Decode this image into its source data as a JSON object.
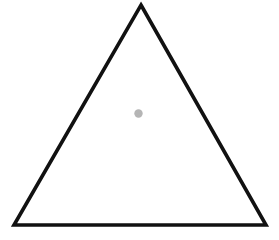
{
  "canvas": {
    "width": 279,
    "height": 240,
    "background_color": "#ffffff"
  },
  "figure": {
    "name": "triangle-with-interior-dot",
    "shapes": [
      {
        "id": "triangle",
        "kind": "triangle-outline",
        "points": "141,5 266,225 14,225",
        "points_list": [
          [
            141,
            5
          ],
          [
            266,
            225
          ],
          [
            14,
            225
          ]
        ],
        "vertices": {
          "apex": [
            141,
            5
          ],
          "bottom_right": [
            266,
            225
          ],
          "bottom_left": [
            14,
            225
          ]
        },
        "stroke_color": "#111111",
        "stroke_width": 3.6,
        "fill_color": "none",
        "stroke_linejoin": "miter"
      },
      {
        "id": "interior-dot",
        "kind": "circle",
        "center": [
          138.5,
          113.5
        ],
        "cx": 138.5,
        "cy": 113.5,
        "radius": 4.2,
        "fill_color": "#b5b5b5",
        "stroke_color": "none"
      }
    ]
  },
  "colors": {
    "background": "#ffffff",
    "outline": "#111111",
    "dot": "#b5b5b5"
  }
}
